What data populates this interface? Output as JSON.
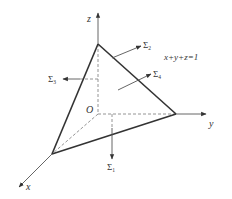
{
  "diagram": {
    "colors": {
      "edge": "#333333",
      "axis": "#555555",
      "hidden": "#888888",
      "background": "#ffffff"
    },
    "axes": {
      "x_label": "x",
      "y_label": "y",
      "z_label": "z",
      "origin_label": "O"
    },
    "plane_label": "x+y+z=1",
    "surfaces": [
      {
        "symbol": "Σ",
        "subscript": "1",
        "description": "bottom face (xy-plane), normal pointing down"
      },
      {
        "symbol": "Σ",
        "subscript": "2",
        "description": "yz-plane face normal"
      },
      {
        "symbol": "Σ",
        "subscript": "3",
        "description": "xz-plane face, normal pointing left"
      },
      {
        "symbol": "Σ",
        "subscript": "4",
        "description": "slanted face x+y+z=1, outward normal"
      }
    ]
  }
}
